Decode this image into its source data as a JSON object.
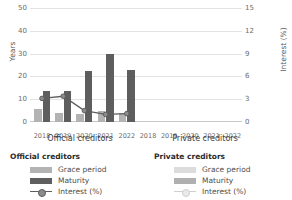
{
  "chart_data": {
    "type": "bar",
    "title": "",
    "categories": [
      "2018",
      "2019",
      "2020",
      "2021",
      "2022"
    ],
    "panels": [
      {
        "name": "Official creditors",
        "series": [
          {
            "name": "Grace period",
            "values": [
              5.5,
              4.0,
              3.5,
              5.0,
              4.0
            ],
            "color": "#b3b3b3",
            "axis": "left"
          },
          {
            "name": "Maturity",
            "values": [
              13.5,
              13.5,
              22.5,
              30.0,
              23.0
            ],
            "color": "#5e5e5e",
            "axis": "left"
          },
          {
            "name": "Interest (%)",
            "values": [
              3.1,
              3.4,
              1.5,
              1.0,
              1.1
            ],
            "color": "#5e5e5e",
            "axis": "right",
            "type": "line"
          }
        ]
      },
      {
        "name": "Private creditors",
        "series": [
          {
            "name": "Grace period",
            "values": [
              null,
              null,
              null,
              null,
              null
            ],
            "color": "#dcdcdc",
            "axis": "left"
          },
          {
            "name": "Maturity",
            "values": [
              null,
              null,
              null,
              null,
              null
            ],
            "color": "#b0b0b0",
            "axis": "left"
          },
          {
            "name": "Interest (%)",
            "values": [
              null,
              null,
              null,
              null,
              null
            ],
            "color": "#cfcfcf",
            "axis": "right",
            "type": "line"
          }
        ]
      }
    ],
    "ylabel": "Years",
    "ylabel_right": "Interest (%)",
    "xlabel": "",
    "ylim": [
      0,
      50
    ],
    "yticks": [
      "0",
      "10",
      "20",
      "30",
      "40",
      "50"
    ],
    "ylim_right": [
      0,
      15
    ],
    "yticks_right": [
      "0",
      "3",
      "6",
      "9",
      "12",
      "15"
    ],
    "grid": true,
    "legend_position": "bottom"
  },
  "axes": {
    "left_title": "Years",
    "right_title": "Interest (%)",
    "left_ticks": [
      "50",
      "40",
      "30",
      "20",
      "10",
      "0"
    ],
    "right_ticks": [
      "15",
      "12",
      "9",
      "6",
      "3",
      "0"
    ],
    "x_ticks_left": [
      "2018",
      "2019",
      "2020",
      "2021",
      "2022"
    ],
    "x_ticks_right": [
      "2018",
      "2019",
      "2020",
      "2021",
      "2022"
    ]
  },
  "panel_captions": {
    "official": "Official creditors",
    "private": "Private creditors"
  },
  "legend": {
    "official": {
      "title": "Official creditors",
      "grace": "Grace period",
      "maturity": "Maturity",
      "interest": "Interest (%)"
    },
    "private": {
      "title": "Private creditors",
      "grace": "Grace period",
      "maturity": "Maturity",
      "interest": "Interest (%)"
    }
  }
}
